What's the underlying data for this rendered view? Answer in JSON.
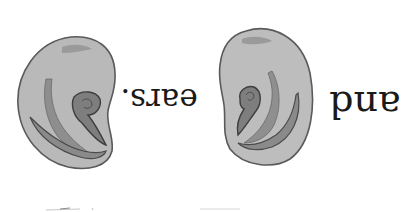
{
  "image": {
    "orientation": "rotated-180",
    "background": "#ffffff",
    "text_upright": "and ears."
  },
  "words": {
    "and": "and",
    "ears": "ears."
  },
  "illustrations": [
    {
      "name": "left-ear",
      "fill": "#b9b9b9",
      "shade": "#8e8e8e",
      "outline": "#4a4a4a"
    },
    {
      "name": "right-ear",
      "fill": "#bdbdbd",
      "shade": "#8f8f8f",
      "outline": "#4a4a4a"
    }
  ]
}
